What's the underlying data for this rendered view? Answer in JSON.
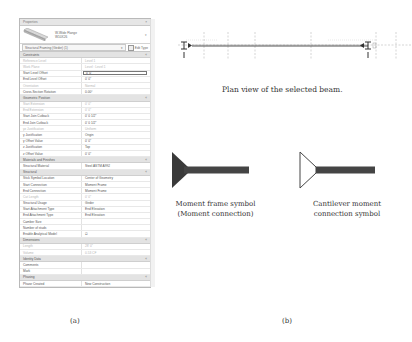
{
  "properties_palette": {
    "title": "Properties",
    "close_glyph": "×",
    "type_selector": {
      "family": "W-Wide Flange",
      "type": "W10X26",
      "dropdown_glyph": "▾"
    },
    "instance_filter": {
      "value": "Structural Framing (Girder) (1)",
      "edit_type_label": "Edit Type"
    },
    "groups": [
      {
        "name": "Constraints",
        "rows": [
          {
            "key": "Reference Level",
            "value": "Level 1",
            "dim": true
          },
          {
            "key": "Work Plane",
            "value": "Level : Level 1",
            "dim": true
          },
          {
            "key": "Start Level Offset",
            "value": "0' 0\"",
            "boxed": true
          },
          {
            "key": "End Level Offset",
            "value": "0' 0\""
          },
          {
            "key": "Orientation",
            "value": "Normal",
            "dim": true
          },
          {
            "key": "Cross-Section Rotation",
            "value": "0.00°"
          }
        ]
      },
      {
        "name": "Geometric Position",
        "rows": [
          {
            "key": "Start Extension",
            "value": "0' 0\"",
            "dim": true
          },
          {
            "key": "End Extension",
            "value": "0' 0\"",
            "dim": true
          },
          {
            "key": "Start Join Cutback",
            "value": "0' 0 1/2\""
          },
          {
            "key": "End Join Cutback",
            "value": "0' 0 1/2\""
          },
          {
            "key": "yz Justification",
            "value": "Uniform",
            "dim": true
          },
          {
            "key": "y Justification",
            "value": "Origin"
          },
          {
            "key": "y Offset Value",
            "value": "0' 0\""
          },
          {
            "key": "z Justification",
            "value": "Top"
          },
          {
            "key": "z Offset Value",
            "value": "0' 0\""
          }
        ]
      },
      {
        "name": "Materials and Finishes",
        "rows": [
          {
            "key": "Structural Material",
            "value": "Steel ASTM A992"
          }
        ]
      },
      {
        "name": "Structural",
        "rows": [
          {
            "key": "Stick Symbol Location",
            "value": "Center of Geometry"
          },
          {
            "key": "Start Connection",
            "value": "Moment Frame"
          },
          {
            "key": "End Connection",
            "value": "Moment Frame"
          },
          {
            "key": "Cut Length",
            "value": "0' 0\"",
            "dim": true
          },
          {
            "key": "Structural Usage",
            "value": "Girder"
          },
          {
            "key": "Start Attachment Type",
            "value": "End Elevation"
          },
          {
            "key": "End Attachment Type",
            "value": "End Elevation"
          },
          {
            "key": "Camber Size",
            "value": ""
          },
          {
            "key": "Number of studs",
            "value": ""
          },
          {
            "key": "Enable Analytical Model",
            "value": "☑"
          }
        ]
      },
      {
        "name": "Dimensions",
        "rows": [
          {
            "key": "Length",
            "value": "28' 0\"",
            "dim": true
          },
          {
            "key": "Volume",
            "value": "0.53 CF",
            "dim": true
          }
        ]
      },
      {
        "name": "Identity Data",
        "rows": [
          {
            "key": "Comments",
            "value": ""
          },
          {
            "key": "Mark",
            "value": ""
          }
        ]
      },
      {
        "name": "Phasing",
        "rows": [
          {
            "key": "Phase Created",
            "value": "New Construction"
          }
        ]
      }
    ]
  },
  "captions": {
    "panel_a": "(a)",
    "panel_b": "(b)",
    "plan_view": "Plan view of the selected beam.",
    "moment_symbol_line1": "Moment frame symbol",
    "moment_symbol_line2": "(Moment connection)",
    "cantilever_symbol_line1": "Cantilever moment",
    "cantilever_symbol_line2": "connection symbol"
  },
  "colors": {
    "beam_line": "#555555",
    "symbol_fill": "#3a3a3a",
    "grid_dash": "#9a9a9a"
  }
}
